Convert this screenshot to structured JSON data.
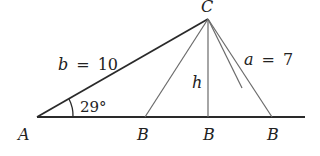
{
  "diagram": {
    "type": "ambiguous-case-triangle",
    "vertices": {
      "A": {
        "label": "A"
      },
      "C": {
        "label": "C"
      },
      "B_left": {
        "label": "B"
      },
      "B_foot": {
        "label": "B"
      },
      "B_right": {
        "label": "B"
      }
    },
    "side_b": {
      "var": "b",
      "eq": "=",
      "value": "10"
    },
    "side_a": {
      "var": "a",
      "eq": "=",
      "value": "7"
    },
    "height": {
      "label": "h"
    },
    "angle_A": {
      "label": "29°"
    },
    "colors": {
      "main_line": "#2a2a2a",
      "thin_line": "#6a6a6a",
      "text": "#222222",
      "background": "#ffffff"
    }
  }
}
